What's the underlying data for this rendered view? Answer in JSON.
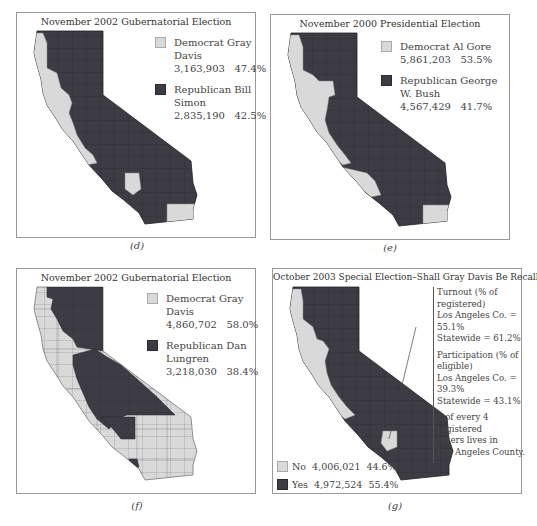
{
  "colors": {
    "democrat_light": "#d9d9d9",
    "republican_dark": "#3d3c45",
    "border": "#9a9a9a"
  },
  "panels": [
    {
      "id": "d",
      "title": "November 2002 Gubernatorial Election",
      "caption": "(d)",
      "legend": [
        {
          "swatch": "light",
          "label": "Democrat Gray Davis",
          "votes": "3,163,903",
          "pct": "47.4%"
        },
        {
          "swatch": "dark",
          "label": "Republican Bill Simon",
          "votes": "2,835,190",
          "pct": "42.5%"
        }
      ]
    },
    {
      "id": "e",
      "title": "November 2000 Presidential Election",
      "caption": "(e)",
      "legend": [
        {
          "swatch": "light",
          "label": "Democrat Al Gore",
          "votes": "5,861,203",
          "pct": "53.5%"
        },
        {
          "swatch": "dark",
          "label": "Republican George W. Bush",
          "votes": "4,567,429",
          "pct": "41.7%"
        }
      ]
    },
    {
      "id": "f",
      "title": "November 2002 Gubernatorial Election",
      "caption": "(f)",
      "legend": [
        {
          "swatch": "light",
          "label": "Democrat Gray Davis",
          "votes": "4,860,702",
          "pct": "58.0%"
        },
        {
          "swatch": "dark",
          "label": "Republican Dan Lungren",
          "votes": "3,218,030",
          "pct": "38.4%"
        }
      ]
    },
    {
      "id": "g",
      "title": "October 2003 Special Election–Shall Gray Davis Be Recalled?",
      "caption": "(g)",
      "notes": [
        [
          "Turnout (% of registered)",
          "Los Angeles Co. = 55.1%",
          "Statewide = 61.2%"
        ],
        [
          "Participation (% of eligible)",
          "Los Angeles Co. = 39.3%",
          "Statewide = 43.1%"
        ],
        [
          "1 of every 4 registered",
          "voters lives in",
          "Los Angeles County."
        ]
      ],
      "legend": [
        {
          "swatch": "light",
          "label": "No",
          "votes": "4,006,021",
          "pct": "44.6%"
        },
        {
          "swatch": "dark",
          "label": "Yes",
          "votes": "4,972,524",
          "pct": "55.4%"
        }
      ]
    }
  ]
}
